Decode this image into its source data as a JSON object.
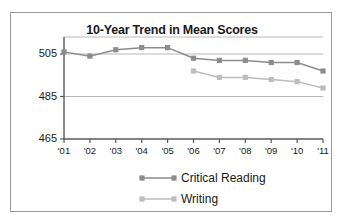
{
  "chart_data": {
    "type": "line",
    "title": "10-Year Trend in Mean Scores",
    "xlabel": "",
    "ylabel": "",
    "categories": [
      "'01",
      "'02",
      "'03",
      "'04",
      "'05",
      "'06",
      "'07",
      "'08",
      "'09",
      "'10",
      "'11"
    ],
    "ylim": [
      465,
      513
    ],
    "yticks": [
      465,
      485,
      505
    ],
    "grid": true,
    "legend_position": "bottom",
    "series": [
      {
        "name": "Critical Reading",
        "color": "#8c8c8c",
        "values": [
          506,
          504,
          507,
          508,
          508,
          503,
          502,
          502,
          501,
          501,
          497
        ]
      },
      {
        "name": "Writing",
        "color": "#bdbdbd",
        "values": [
          null,
          null,
          null,
          null,
          null,
          497,
          494,
          494,
          493,
          492,
          489
        ]
      }
    ]
  },
  "legend": {
    "items": [
      {
        "label": "Critical Reading",
        "color": "#8c8c8c"
      },
      {
        "label": "Writing",
        "color": "#bdbdbd"
      }
    ]
  },
  "colors": {
    "frame_border": "#9a9a9a",
    "axis": "#5a5a5a",
    "grid": "#b9b9b9",
    "text": "#1a1a1a",
    "background": "#ffffff"
  }
}
